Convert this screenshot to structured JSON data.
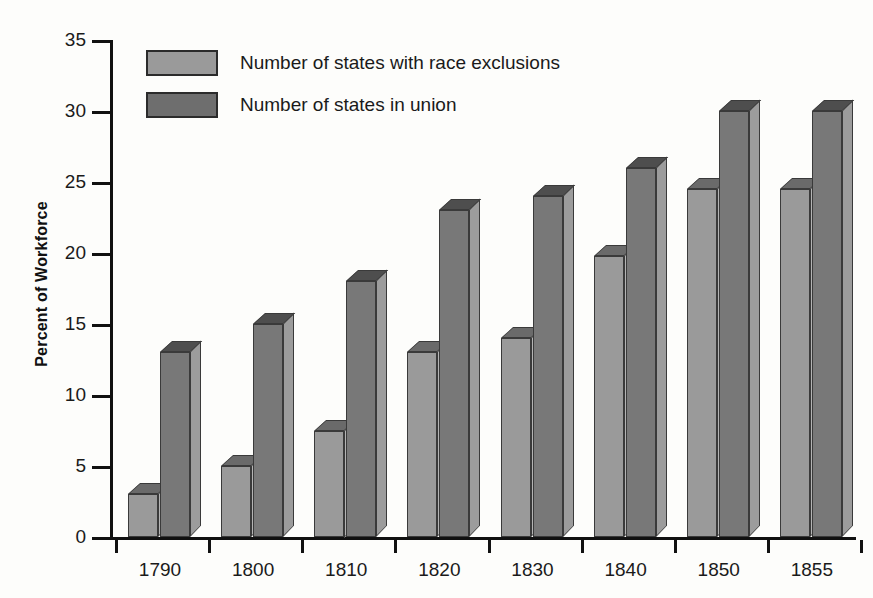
{
  "chart_data": {
    "type": "bar",
    "title": "",
    "xlabel": "",
    "ylabel": "Percent of Workforce",
    "categories": [
      "1790",
      "1800",
      "1810",
      "1820",
      "1830",
      "1840",
      "1850",
      "1855"
    ],
    "ylim": [
      0,
      35
    ],
    "yticks": [
      0,
      5,
      10,
      15,
      20,
      25,
      30,
      35
    ],
    "ytick_labels": [
      "0",
      "5",
      "10",
      "15",
      "20",
      "25",
      "30",
      "35"
    ],
    "grid": false,
    "legend_position": "top-left",
    "series": [
      {
        "name": "Number of states with race exclusions",
        "color": "#9a9a9a",
        "values": [
          3,
          5,
          7.5,
          13,
          14,
          19.8,
          24.5,
          24.5
        ]
      },
      {
        "name": "Number of states in union",
        "color": "#6e6e6e",
        "values": [
          13,
          15,
          18,
          23,
          24,
          26,
          30,
          30
        ]
      }
    ]
  },
  "legend": {
    "items": [
      {
        "label": "Number of states with race exclusions",
        "swatch": "light"
      },
      {
        "label": "Number of states in union",
        "swatch": "dark"
      }
    ]
  },
  "axes": {
    "y_title": "Percent of Workforce"
  }
}
